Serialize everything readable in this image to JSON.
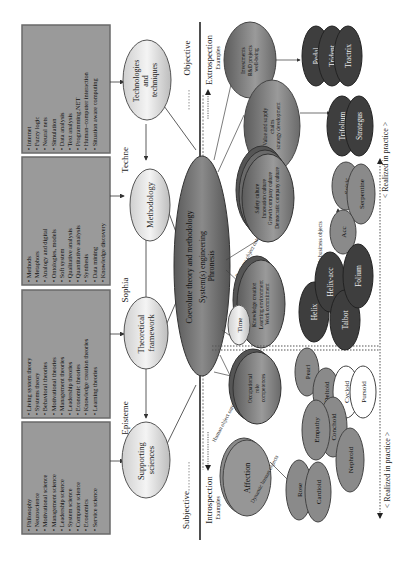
{
  "diagram": {
    "orientation": "rotated-90-ccw",
    "colors": {
      "box_fill": "#9a9a9a",
      "box_border": "#6a6a6a",
      "light_ellipse": "#e4e4e4",
      "center_ellipse": "#6e6e6e",
      "dark_ellipse": "#3e3e3e",
      "mid_ellipse": "#8a8a8a",
      "white_ellipse": "#ffffff",
      "line": "#333333"
    },
    "boxes": {
      "technologies": {
        "items": [
          "Internet",
          "Fuzzy logic",
          "Neural nets",
          "Simulation",
          "Data analysis",
          "Text analysis",
          "Programming.NET",
          "Human–computer interaction",
          "Situation aware computing"
        ]
      },
      "methodology": {
        "items": [
          "Methods",
          "Metaphors",
          "Analogy and digital",
          "Ontologies, models",
          "Soft system",
          "Qualitative analysis",
          "Quantitative analysis",
          "Synthesis",
          "Data mining",
          "Knowledge discovery"
        ]
      },
      "theoretical": {
        "items": [
          "Living system theory",
          "Systems theory",
          "Behavioral theories",
          "Motivational theories",
          "Management theories",
          "Leadership theories",
          "Economic theories",
          "Knowledge creation theories",
          "Learning theories"
        ]
      },
      "supporting": {
        "items": [
          "Philosophy",
          "Neuroscience",
          "Motivational science",
          "Management science",
          "Leadership science",
          "System science",
          "Computer science",
          "Economics",
          "Service science"
        ]
      }
    },
    "column_labels": {
      "techne": "Techne",
      "sophia": "Sophia",
      "episteme": "Episteme"
    },
    "level_nodes": {
      "technologies": [
        "Technologies",
        "and",
        "techniques"
      ],
      "methodology": [
        "Methodology"
      ],
      "theoretical": [
        "Theoretical",
        "framework"
      ],
      "supporting": [
        "Supporting",
        "sciences"
      ]
    },
    "center": {
      "line1": "Coevolute theory and methodology",
      "line2": "System(s) engineering",
      "line3": "Phronesis"
    },
    "axis": {
      "objective": "Objective",
      "subjective": "Subjective",
      "extrospection": "Extrospection",
      "introspection": "Introspection",
      "examples_top": "Examples",
      "examples_bottom": "Examples"
    },
    "top_nodes": {
      "investments": [
        "Investments",
        "R&D projects",
        "well-being"
      ],
      "value_chains": [
        "Value and supply",
        "chains",
        "strategy development"
      ],
      "culture": [
        "Safety culture",
        "Innovation culture",
        "Growth company culture",
        "Democratic company culture"
      ],
      "knowledge": [
        "Knowledge creation",
        "Learning environment",
        "Work commitment"
      ],
      "time": "Time",
      "occupational": [
        "Occupational",
        "role",
        "competences"
      ],
      "affection": "Affection"
    },
    "edge_labels": {
      "business_ontologies": "Business object ontologies",
      "human_ontologies": "Human object ontologies",
      "dynamic_business": "Dynamic business objects",
      "dynamic_human": "Dynamic human objects"
    },
    "curves": {
      "pedal": "Pedal",
      "trident": "Trident",
      "tractrix": "Tractrix",
      "trifolium": "Trifolium",
      "strategus": "Strategus",
      "spiric": "Spiric",
      "serpentine": "Serpentine",
      "acc": "Acc",
      "helix": "Helix",
      "helix_acc": "Helix-acc",
      "folium": "Folium",
      "talbot": "Talbot",
      "pearl": "Pearl",
      "deltoid": "Deltoid",
      "cycloid": "Cycloid",
      "pursoid": "Pursoid",
      "empathy": "Empathy",
      "conchoid": "Conchoid",
      "nephroid": "Nephroid",
      "rose": "Rose",
      "cardioid": "Cardioid"
    },
    "realized": {
      "top": "< Realized in practice >",
      "bottom": "< Realized in practice >"
    }
  }
}
